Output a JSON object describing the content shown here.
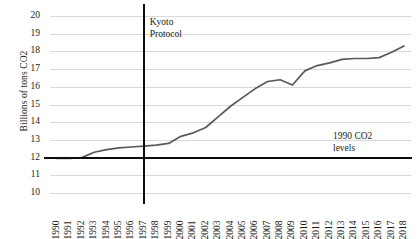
{
  "chart_data": {
    "type": "line",
    "title": "",
    "xlabel": "",
    "ylabel": "Billions of tons CO2",
    "ylim": [
      10,
      20
    ],
    "yticks": [
      10,
      11,
      12,
      13,
      14,
      15,
      16,
      17,
      18,
      19,
      20
    ],
    "grid": true,
    "legend": null,
    "categories": [
      "1990",
      "1991",
      "1992",
      "1993",
      "1994",
      "1995",
      "1996",
      "1997",
      "1998",
      "1999",
      "2000",
      "2001",
      "2002",
      "2003",
      "2004",
      "2005",
      "2006",
      "2007",
      "2008",
      "2009",
      "2010",
      "2011",
      "2012",
      "2013",
      "2014",
      "2015",
      "2016",
      "2017",
      "2018"
    ],
    "values": [
      11.95,
      11.95,
      12.0,
      12.3,
      12.45,
      12.55,
      12.6,
      12.65,
      12.7,
      12.8,
      13.2,
      13.4,
      13.7,
      14.3,
      14.9,
      15.4,
      15.9,
      16.3,
      16.4,
      16.1,
      16.9,
      17.2,
      17.35,
      17.55,
      17.6,
      17.6,
      17.65,
      17.95,
      18.3
    ],
    "annotations": [
      {
        "name": "kyoto-protocol",
        "text": "Kyoto\nProtocol",
        "line1": "Kyoto",
        "line2": "Protocol",
        "at_x": "1997",
        "type": "vline"
      },
      {
        "name": "1990-co2-levels",
        "text": "1990 CO2\nlevels",
        "line1": "1990 CO2",
        "line2": "levels",
        "at_y": 12,
        "type": "hline"
      }
    ],
    "colors": {
      "series": "#595959",
      "reference": "#0d0d0d",
      "grid": "#d9d9d9",
      "text": "#1a1a1a"
    }
  }
}
